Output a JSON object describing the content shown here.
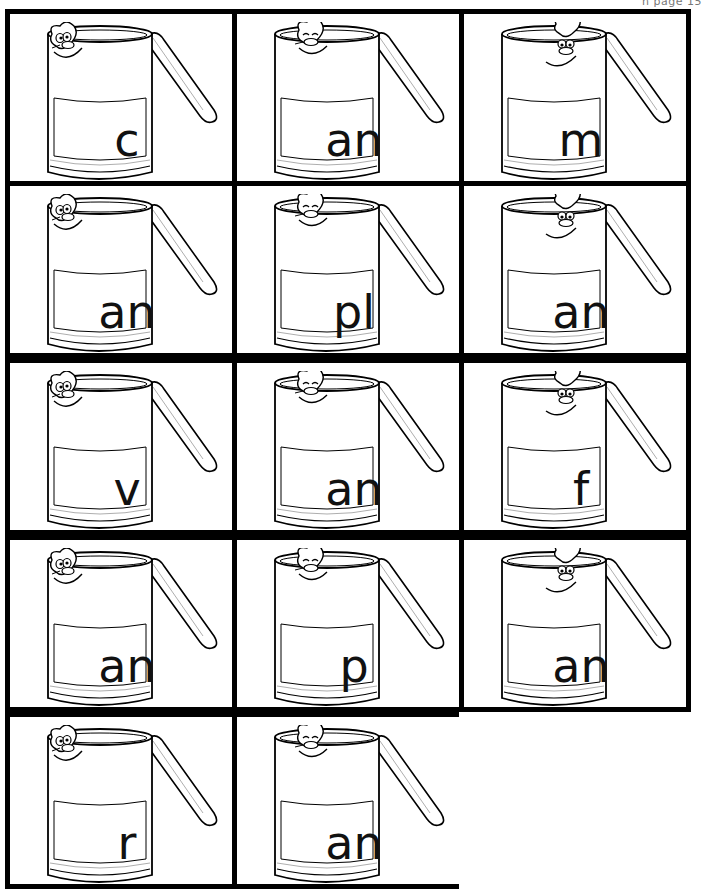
{
  "header": {
    "note": "n page 15"
  },
  "cards": [
    {
      "text": "c",
      "face": "left"
    },
    {
      "text": "an",
      "face": "middle"
    },
    {
      "text": "m",
      "face": "right"
    },
    {
      "text": "an",
      "face": "left"
    },
    {
      "text": "pl",
      "face": "middle"
    },
    {
      "text": "an",
      "face": "right"
    },
    {
      "text": "v",
      "face": "left"
    },
    {
      "text": "an",
      "face": "middle"
    },
    {
      "text": "f",
      "face": "right"
    },
    {
      "text": "an",
      "face": "left"
    },
    {
      "text": "p",
      "face": "middle"
    },
    {
      "text": "an",
      "face": "right"
    },
    {
      "text": "r",
      "face": "left"
    },
    {
      "text": "an",
      "face": "middle"
    }
  ]
}
